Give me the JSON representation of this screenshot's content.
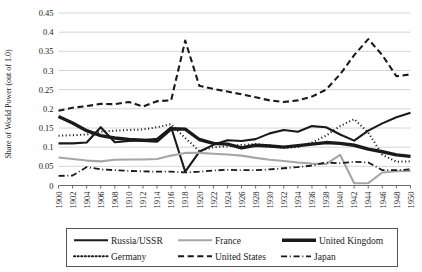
{
  "chart_data": {
    "type": "line",
    "title": "",
    "xlabel": "",
    "ylabel": "Share of World Power (out of 1.0)",
    "grid": true,
    "legend_position": "bottom",
    "ylim": [
      0,
      0.45
    ],
    "xlim": [
      1900,
      1950
    ],
    "yticks": [
      "0",
      "0.05",
      "0.1",
      "0.15",
      "0.2",
      "0.25",
      "0.3",
      "0.35",
      "0.4",
      "0.45"
    ],
    "ytick_values": [
      0,
      0.05,
      0.1,
      0.15,
      0.2,
      0.25,
      0.3,
      0.35,
      0.4,
      0.45
    ],
    "x": [
      1900,
      1902,
      1904,
      1906,
      1908,
      1910,
      1912,
      1914,
      1916,
      1918,
      1920,
      1922,
      1924,
      1926,
      1928,
      1930,
      1932,
      1934,
      1936,
      1938,
      1940,
      1942,
      1944,
      1946,
      1948,
      1950
    ],
    "xticks": [
      "1900",
      "1902",
      "1904",
      "1906",
      "1908",
      "1910",
      "1912",
      "1914",
      "1916",
      "1918",
      "1920",
      "1922",
      "1924",
      "1926",
      "1928",
      "1930",
      "1932",
      "1934",
      "1936",
      "1938",
      "1940",
      "1942",
      "1944",
      "1946",
      "1948",
      "1950"
    ],
    "series": [
      {
        "name": "Russia/USSR",
        "style": "solid",
        "color": "#1a1a1a",
        "width": 2.1,
        "values": [
          0.11,
          0.11,
          0.112,
          0.152,
          0.113,
          0.116,
          0.118,
          0.122,
          0.152,
          0.036,
          0.088,
          0.106,
          0.118,
          0.116,
          0.121,
          0.136,
          0.145,
          0.14,
          0.155,
          0.152,
          0.133,
          0.117,
          0.143,
          0.162,
          0.178,
          0.19
        ]
      },
      {
        "name": "France",
        "style": "solid",
        "color": "#a6a6a6",
        "width": 2.1,
        "values": [
          0.073,
          0.069,
          0.065,
          0.063,
          0.067,
          0.068,
          0.068,
          0.069,
          0.078,
          0.085,
          0.085,
          0.083,
          0.081,
          0.078,
          0.072,
          0.067,
          0.064,
          0.06,
          0.057,
          0.056,
          0.08,
          0.006,
          0.006,
          0.034,
          0.037,
          0.038
        ]
      },
      {
        "name": "United Kingdom",
        "style": "solid",
        "color": "#1a1a1a",
        "width": 3.4,
        "values": [
          0.18,
          0.163,
          0.143,
          0.13,
          0.124,
          0.12,
          0.118,
          0.116,
          0.148,
          0.147,
          0.12,
          0.11,
          0.108,
          0.098,
          0.105,
          0.103,
          0.1,
          0.104,
          0.108,
          0.112,
          0.11,
          0.105,
          0.095,
          0.088,
          0.08,
          0.076
        ]
      },
      {
        "name": "Germany",
        "style": "dotted",
        "color": "#1a1a1a",
        "width": 2.0,
        "values": [
          0.13,
          0.131,
          0.133,
          0.14,
          0.143,
          0.145,
          0.146,
          0.152,
          0.16,
          0.124,
          0.09,
          0.1,
          0.102,
          0.106,
          0.108,
          0.105,
          0.098,
          0.1,
          0.112,
          0.13,
          0.155,
          0.173,
          0.138,
          0.08,
          0.062,
          0.063
        ]
      },
      {
        "name": "United States",
        "style": "dashed",
        "color": "#1a1a1a",
        "width": 2.1,
        "values": [
          0.195,
          0.203,
          0.207,
          0.213,
          0.212,
          0.218,
          0.206,
          0.22,
          0.222,
          0.378,
          0.26,
          0.252,
          0.245,
          0.238,
          0.23,
          0.222,
          0.218,
          0.222,
          0.232,
          0.25,
          0.29,
          0.34,
          0.382,
          0.34,
          0.285,
          0.29
        ]
      },
      {
        "name": "Japan",
        "style": "dashdot",
        "color": "#1a1a1a",
        "width": 1.8,
        "values": [
          0.025,
          0.026,
          0.048,
          0.042,
          0.04,
          0.038,
          0.037,
          0.036,
          0.036,
          0.034,
          0.036,
          0.039,
          0.041,
          0.04,
          0.04,
          0.042,
          0.045,
          0.048,
          0.052,
          0.06,
          0.058,
          0.062,
          0.06,
          0.04,
          0.04,
          0.042
        ]
      }
    ]
  },
  "legend": {
    "entries": [
      {
        "label": "Russia/USSR"
      },
      {
        "label": "France"
      },
      {
        "label": "United Kingdom"
      },
      {
        "label": "Germany"
      },
      {
        "label": "United States"
      },
      {
        "label": "Japan"
      }
    ]
  }
}
